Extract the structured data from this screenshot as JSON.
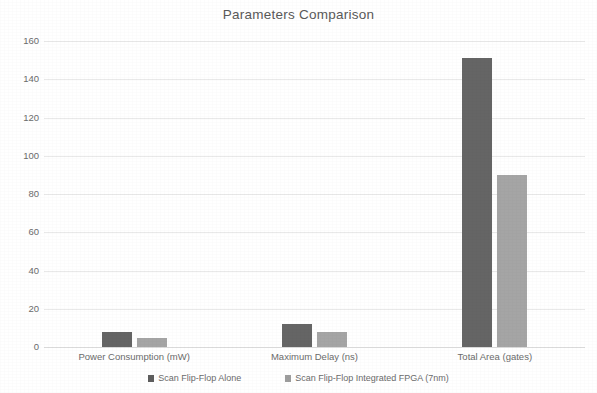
{
  "chart_data": {
    "type": "bar",
    "title": "Parameters Comparison",
    "xlabel": "",
    "ylabel": "",
    "ylim": [
      0,
      160
    ],
    "yticks": [
      0,
      20,
      40,
      60,
      80,
      100,
      120,
      140,
      160
    ],
    "grid": true,
    "legend_position": "bottom",
    "categories": [
      "Power Consumption (mW)",
      "Maximum Delay (ns)",
      "Total Area (gates)"
    ],
    "series": [
      {
        "name": "Scan Flip-Flop Alone",
        "color": "#656565",
        "values": [
          8,
          12,
          151
        ]
      },
      {
        "name": "Scan Flip-Flop Integrated FPGA (7nm)",
        "color": "#a5a5a5",
        "values": [
          4.5,
          8,
          90
        ]
      }
    ]
  },
  "colors": {
    "series_dark": "#656565",
    "series_light": "#a5a5a5",
    "gridline": "#e9e9e9",
    "text": "#6b6b6b",
    "title": "#595959",
    "background": "#ffffff"
  }
}
